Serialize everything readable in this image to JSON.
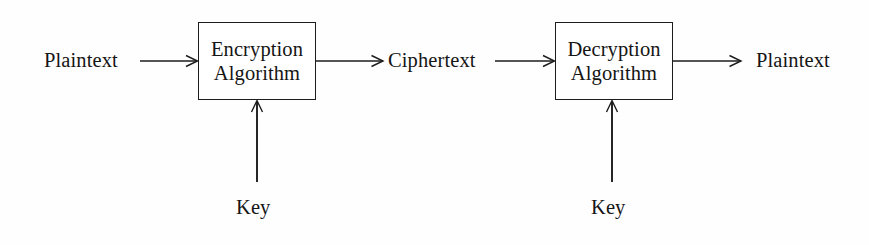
{
  "diagram": {
    "background_color": "#fefefe",
    "stroke_color": "#1c1c1c",
    "text_color": "#151515",
    "boxes": [
      {
        "id": "encryption",
        "line1": "Encryption",
        "line2": "Algorithm",
        "x": 198,
        "y": 22,
        "width": 118,
        "height": 78
      },
      {
        "id": "decryption",
        "line1": "Decryption",
        "line2": "Algorithm",
        "x": 555,
        "y": 22,
        "width": 118,
        "height": 78
      }
    ],
    "labels": {
      "input_plaintext": "Plaintext",
      "ciphertext": "Ciphertext",
      "output_plaintext": "Plaintext",
      "key_left": "Key",
      "key_right": "Key"
    },
    "arrows": [
      {
        "id": "plaintext-to-encryption",
        "from": [
          140,
          61
        ],
        "to": [
          198,
          61
        ],
        "direction": "right"
      },
      {
        "id": "encryption-to-ciphertext",
        "from": [
          316,
          61
        ],
        "to": [
          383,
          61
        ],
        "direction": "right"
      },
      {
        "id": "ciphertext-to-decryption",
        "from": [
          495,
          61
        ],
        "to": [
          555,
          61
        ],
        "direction": "right"
      },
      {
        "id": "decryption-to-plaintext",
        "from": [
          673,
          61
        ],
        "to": [
          741,
          61
        ],
        "direction": "right"
      },
      {
        "id": "key-left-to-encryption",
        "from": [
          257,
          182
        ],
        "to": [
          257,
          100
        ],
        "direction": "up"
      },
      {
        "id": "key-right-to-decryption",
        "from": [
          612,
          182
        ],
        "to": [
          612,
          100
        ],
        "direction": "up"
      }
    ]
  }
}
